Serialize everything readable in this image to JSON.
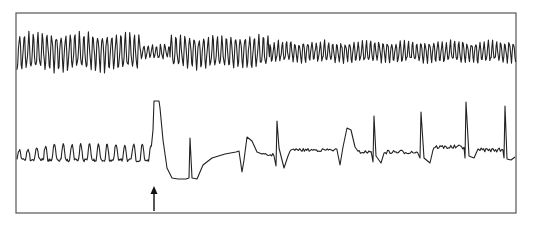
{
  "figure": {
    "frame": {
      "x": 16,
      "y": 13,
      "width": 500,
      "height": 200,
      "stroke": "#555555"
    },
    "trace_color": "#222222",
    "arrow": {
      "x": 154,
      "y_top": 186,
      "y_bottom": 211,
      "color": "#111111"
    },
    "traces": [
      {
        "name": "upper-trace",
        "baseline": 52,
        "segments": [
          {
            "x0": 17,
            "x1": 140,
            "period": 4.6,
            "amp": 16
          },
          {
            "x0": 140,
            "x1": 170,
            "period": 4.2,
            "amp": 6
          },
          {
            "x0": 170,
            "x1": 270,
            "period": 4.6,
            "amp": 14
          },
          {
            "x0": 270,
            "x1": 516,
            "period": 4.2,
            "amp": 9
          }
        ]
      },
      {
        "name": "lower-trace",
        "baseline": 157,
        "pre_event": {
          "x0": 17,
          "x1": 152,
          "period": 8.8,
          "amp": 13
        },
        "events": [
          {
            "type": "big-peak",
            "x": 154,
            "top": 101
          },
          {
            "type": "trough-plateau",
            "x0": 167,
            "x1": 197,
            "y": 179
          },
          {
            "type": "spike",
            "x": 190,
            "top": 138
          },
          {
            "type": "dip-bump",
            "x": 242
          },
          {
            "type": "spike",
            "x": 277,
            "top": 121
          },
          {
            "type": "bump",
            "x": 346
          },
          {
            "type": "spike",
            "x": 374,
            "top": 116
          },
          {
            "type": "spike",
            "x": 421,
            "top": 112
          },
          {
            "type": "spike",
            "x": 466,
            "top": 102
          },
          {
            "type": "spike",
            "x": 505,
            "top": 106
          }
        ]
      }
    ]
  }
}
